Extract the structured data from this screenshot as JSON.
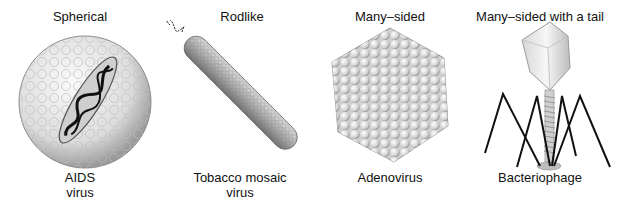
{
  "figure": {
    "panels": [
      {
        "shape": "Spherical",
        "name_line1": "AIDS",
        "name_line2": "virus",
        "icon": "spherical-virus-icon"
      },
      {
        "shape": "Rodlike",
        "name_line1": "Tobacco mosaic",
        "name_line2": "virus",
        "icon": "rodlike-virus-icon"
      },
      {
        "shape": "Many–sided",
        "name_line1": "Adenovirus",
        "name_line2": "",
        "icon": "polyhedral-virus-icon"
      },
      {
        "shape": "Many–sided  with a tail",
        "name_line1": "Bacteriophage",
        "name_line2": "",
        "icon": "bacteriophage-icon"
      }
    ]
  },
  "colors": {
    "background": "#ffffff",
    "text": "#111111",
    "virus_fill": "#e6e6e6",
    "virus_shade": "#9a9a9a",
    "tail_legs": "#111111"
  }
}
